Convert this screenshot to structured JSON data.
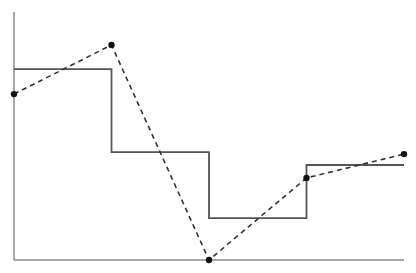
{
  "chart_data": {
    "type": "line",
    "title": "",
    "xlabel": "",
    "ylabel": "",
    "x": [
      0,
      1,
      2,
      3,
      4
    ],
    "xlim": [
      0,
      4
    ],
    "ylim": [
      0,
      10
    ],
    "grid": false,
    "legend": null,
    "series": [
      {
        "name": "step",
        "style": "solid",
        "drawstyle": "steps-post",
        "color": "#555555",
        "markers": false,
        "values": [
          7.7,
          4.35,
          1.69,
          3.83,
          3.83
        ]
      },
      {
        "name": "points",
        "style": "dashed",
        "color": "#333333",
        "markers": true,
        "marker_color": "#111111",
        "values": [
          6.69,
          8.67,
          0.0,
          3.31,
          4.27
        ]
      }
    ]
  },
  "layout": {
    "plot_left": 14,
    "plot_right": 404,
    "plot_top": 12,
    "plot_bottom": 260,
    "axis_color": "#8a8a8a"
  }
}
